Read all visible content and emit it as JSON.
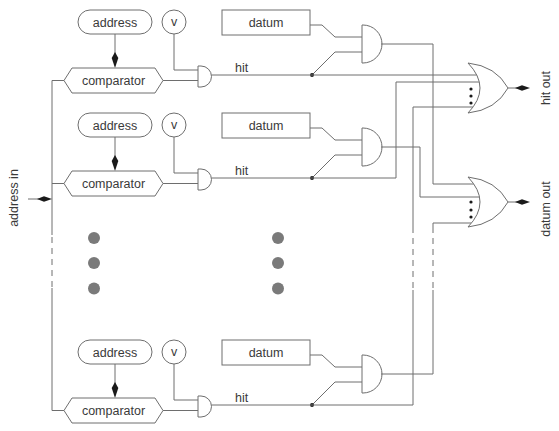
{
  "diagram": {
    "input_label": "address in",
    "outputs": {
      "hit": "hit out",
      "datum": "datum out"
    },
    "rows": [
      {
        "address": "address",
        "valid": "v",
        "datum": "datum",
        "comparator": "comparator",
        "hit": "hit"
      },
      {
        "address": "address",
        "valid": "v",
        "datum": "datum",
        "comparator": "comparator",
        "hit": "hit"
      },
      {
        "address": "address",
        "valid": "v",
        "datum": "datum",
        "comparator": "comparator",
        "hit": "hit"
      }
    ],
    "ellipsis": {
      "columns": 2,
      "dots_per_column": 3
    },
    "colors": {
      "line": "#6e6e6e",
      "text": "#3a3a3a",
      "ellipsis_dot": "#7a7a7a",
      "arrowhead": "#1a1a1a",
      "background": "#ffffff"
    }
  }
}
